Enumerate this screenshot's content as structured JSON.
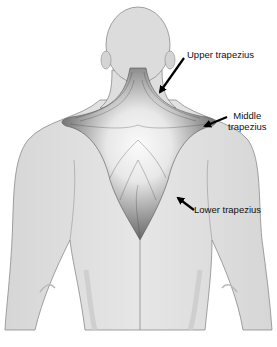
{
  "figure": {
    "colors": {
      "skin": "#e2e2e2",
      "outline": "#8a8a8a",
      "muscle_dark": "#4a4a4a",
      "muscle_light": "#f4f4f4",
      "arrow": "#000000",
      "background": "#ffffff"
    }
  },
  "labels": [
    {
      "id": "upper",
      "lines": [
        "Upper trapezius"
      ]
    },
    {
      "id": "middle",
      "lines": [
        "Middle",
        "trapezius"
      ]
    },
    {
      "id": "lower",
      "lines": [
        "Lower trapezius"
      ]
    }
  ]
}
